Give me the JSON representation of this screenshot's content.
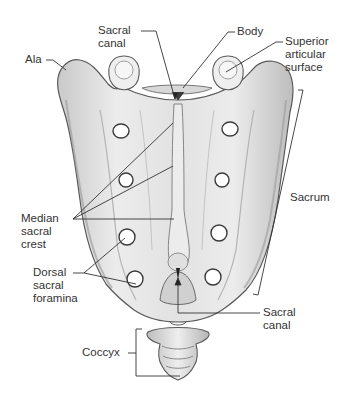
{
  "diagram": {
    "colors": {
      "bone_fill": "#e4e4e4",
      "bone_shade": "#a9a9a9",
      "bone_outline": "#5a5a5a",
      "leader_line": "#333333",
      "foramen": "#ffffff",
      "text": "#333333"
    },
    "labels": {
      "sacral_canal_top": {
        "lines": [
          "Sacral",
          "canal"
        ]
      },
      "body": {
        "lines": [
          "Body"
        ]
      },
      "ala": {
        "lines": [
          "Ala"
        ]
      },
      "superior_articular_surface": {
        "lines": [
          "Superior",
          "articular",
          "surface"
        ]
      },
      "sacrum": {
        "lines": [
          "Sacrum"
        ]
      },
      "median_sacral_crest": {
        "lines": [
          "Median",
          "sacral",
          "crest"
        ]
      },
      "dorsal_sacral_foramina": {
        "lines": [
          "Dorsal",
          "sacral",
          "foramina"
        ]
      },
      "sacral_canal_bottom": {
        "lines": [
          "Sacral",
          "canal"
        ]
      },
      "coccyx": {
        "lines": [
          "Coccyx"
        ]
      }
    }
  }
}
